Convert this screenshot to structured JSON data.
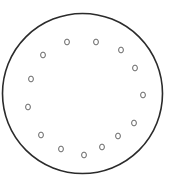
{
  "diagram": {
    "outer_circle": {
      "cx": 82.5,
      "cy": 93.5,
      "r": 80,
      "stroke": "#2b2b2b",
      "stroke_width": 1.6
    },
    "hole_style": {
      "rx": 2.4,
      "ry": 2.9,
      "stroke": "#555555",
      "stroke_width": 0.9
    },
    "holes": [
      {
        "cx": 67,
        "cy": 42
      },
      {
        "cx": 96,
        "cy": 42
      },
      {
        "cx": 121,
        "cy": 50
      },
      {
        "cx": 135,
        "cy": 68
      },
      {
        "cx": 143,
        "cy": 95
      },
      {
        "cx": 134,
        "cy": 123
      },
      {
        "cx": 118,
        "cy": 136
      },
      {
        "cx": 102,
        "cy": 147
      },
      {
        "cx": 84,
        "cy": 155
      },
      {
        "cx": 61,
        "cy": 149
      },
      {
        "cx": 41,
        "cy": 135
      },
      {
        "cx": 28,
        "cy": 107
      },
      {
        "cx": 31,
        "cy": 79
      },
      {
        "cx": 43,
        "cy": 55
      }
    ]
  }
}
